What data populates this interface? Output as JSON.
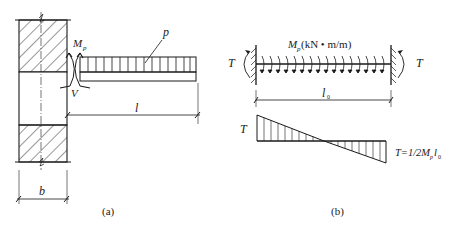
{
  "figure_a": {
    "caption": "(a)",
    "labels": {
      "moment": "M",
      "moment_sub": "p",
      "shear": "V",
      "load": "p",
      "span": "l",
      "width": "b"
    }
  },
  "figure_b": {
    "caption": "(b)",
    "labels": {
      "moment_M": "M",
      "moment_sub": "p",
      "moment_units": "(kN • m/m)",
      "torque_left": "T",
      "torque_right": "T",
      "span_l": "l",
      "span_sub": "0",
      "diagram_T": "T",
      "formula_T": "T=1/2M",
      "formula_sub_p": "p",
      "formula_l": "l",
      "formula_sub_0": "0"
    }
  },
  "colors": {
    "ink": "#1a1a1a",
    "background": "#ffffff"
  }
}
